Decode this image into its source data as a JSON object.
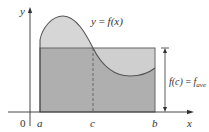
{
  "figure": {
    "curve_label": "y = f(x)",
    "curve_label_parts": {
      "lhs": "y",
      "eq": " = ",
      "rhs": "f(x)"
    },
    "axis": {
      "y_label": "y",
      "x_label": "x",
      "origin_label": "0"
    },
    "ticks": {
      "a": "a",
      "b": "b",
      "c": "c"
    },
    "height_label": {
      "lhs": "f(c)",
      "eq": " = ",
      "f": "f",
      "sub": "ave"
    },
    "colors": {
      "curve_area_fill": "#d6d6d6",
      "rectangle_fill": "#a8a8a8",
      "curve_stroke": "#555555",
      "axis_stroke": "#333333",
      "background": "#ffffff"
    }
  }
}
